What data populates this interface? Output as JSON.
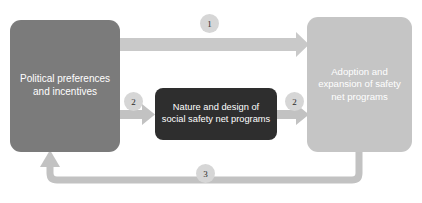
{
  "diagram": {
    "type": "flow-diagram",
    "background_color": "#ffffff",
    "nodes": [
      {
        "id": "political",
        "label": "Political preferences and incentives",
        "color": "#7b7b7b",
        "text_color": "#ffffff"
      },
      {
        "id": "nature",
        "label": "Nature and design of social safety net programs",
        "color": "#2e2e2e",
        "text_color": "#ffffff"
      },
      {
        "id": "adoption",
        "label": "Adoption and expansion of safety net programs",
        "color": "#c5c5c5",
        "text_color": "#ffffff"
      }
    ],
    "edges": [
      {
        "id": "edge-1",
        "badge": "1",
        "from": "political",
        "to": "adoption",
        "color": "#c9c9c9"
      },
      {
        "id": "edge-2-left",
        "badge": "2",
        "from": "political",
        "to": "nature",
        "color": "#c2c2c2"
      },
      {
        "id": "edge-2-right",
        "badge": "2",
        "from": "nature",
        "to": "adoption",
        "color": "#c2c2c2"
      },
      {
        "id": "edge-3",
        "badge": "3",
        "from": "adoption",
        "to": "political",
        "color": "#c2c2c2"
      }
    ],
    "badge_color": "#d6d6d6",
    "badge_text_color": "#2b2b2b"
  }
}
